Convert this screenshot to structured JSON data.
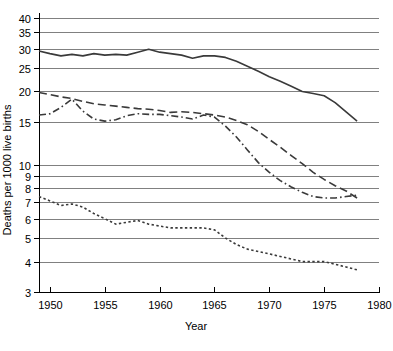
{
  "chart_data": {
    "type": "line",
    "title": "",
    "xlabel": "Year",
    "ylabel": "Deaths per 1000 live births",
    "yscale": "log",
    "ylim": [
      3,
      42
    ],
    "xlim": [
      1949,
      1980
    ],
    "grid": true,
    "legend_position": "none",
    "x_ticks": [
      1950,
      1955,
      1960,
      1965,
      1970,
      1975,
      1980
    ],
    "x_tick_labels": [
      "1950",
      "1955",
      "1960",
      "1965",
      "1970",
      "1975",
      "1980"
    ],
    "y_ticks": [
      3,
      4,
      5,
      6,
      7,
      8,
      9,
      10,
      15,
      20,
      25,
      30,
      35,
      40
    ],
    "y_tick_labels": [
      "3",
      "4",
      "5",
      "6",
      "7",
      "8",
      "9",
      "10",
      "15",
      "20",
      "25",
      "30",
      "35",
      "40"
    ],
    "x": [
      1949,
      1950,
      1951,
      1952,
      1953,
      1954,
      1955,
      1956,
      1957,
      1958,
      1959,
      1960,
      1961,
      1962,
      1963,
      1964,
      1965,
      1966,
      1967,
      1968,
      1969,
      1970,
      1971,
      1972,
      1973,
      1974,
      1975,
      1976,
      1977,
      1978
    ],
    "series": [
      {
        "name": "series-solid",
        "style": "solid",
        "color": "#3a3a3a",
        "values": [
          29.3,
          28.6,
          28.0,
          28.4,
          28.0,
          28.6,
          28.2,
          28.4,
          28.2,
          29.0,
          29.8,
          29.0,
          28.6,
          28.2,
          27.4,
          28.0,
          28.0,
          27.6,
          26.6,
          25.4,
          24.2,
          23.0,
          22.0,
          21.0,
          20.0,
          19.6,
          19.2,
          18.0,
          16.5,
          15.1
        ]
      },
      {
        "name": "series-dashed",
        "style": "dashed",
        "color": "#3a3a3a",
        "values": [
          19.8,
          19.4,
          19.0,
          18.7,
          18.2,
          17.8,
          17.6,
          17.4,
          17.2,
          17.0,
          16.9,
          16.7,
          16.4,
          16.5,
          16.4,
          16.2,
          16.0,
          15.7,
          15.2,
          14.6,
          13.7,
          12.7,
          11.8,
          10.9,
          10.1,
          9.3,
          8.7,
          8.2,
          7.8,
          7.3
        ]
      },
      {
        "name": "series-dash-dot",
        "style": "dash-dot",
        "color": "#3a3a3a",
        "values": [
          16.0,
          16.2,
          17.2,
          18.6,
          16.6,
          15.4,
          15.1,
          15.3,
          15.9,
          16.2,
          16.1,
          16.1,
          15.9,
          15.7,
          15.4,
          16.0,
          15.7,
          14.4,
          13.0,
          11.5,
          10.2,
          9.3,
          8.6,
          8.1,
          7.7,
          7.4,
          7.3,
          7.3,
          7.4,
          7.5
        ]
      },
      {
        "name": "series-dotted",
        "style": "dotted",
        "color": "#3a3a3a",
        "values": [
          7.4,
          7.1,
          6.8,
          6.9,
          6.7,
          6.3,
          6.0,
          5.7,
          5.8,
          5.9,
          5.7,
          5.6,
          5.5,
          5.5,
          5.5,
          5.5,
          5.4,
          5.0,
          4.7,
          4.5,
          4.4,
          4.3,
          4.2,
          4.1,
          4.0,
          4.0,
          4.0,
          3.9,
          3.8,
          3.7
        ]
      }
    ]
  }
}
